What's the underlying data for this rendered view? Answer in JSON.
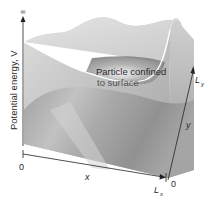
{
  "figure": {
    "y_axis_label": "Potential energy, V",
    "y_axis_top": "∞",
    "x_axis_label": "x",
    "y2_axis_label": "y",
    "origin_label": "0",
    "lx_label": "L",
    "lx_sub": "x",
    "ly_label": "L",
    "ly_sub": "y",
    "y_origin_label": "0",
    "annotation_line1": "Particle confined",
    "annotation_line2": "to surface",
    "colors": {
      "surface_light": "#d9d9d9",
      "surface_mid": "#b3b3b3",
      "surface_dark": "#8a8a8a",
      "axis": "#222222",
      "highlight": "#ffffff"
    }
  }
}
